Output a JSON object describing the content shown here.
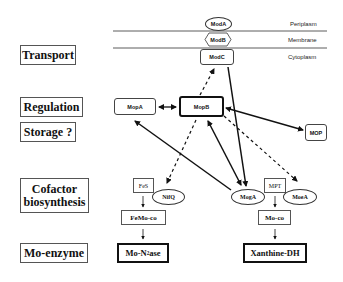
{
  "categories": {
    "transport": "Transport",
    "regulation": "Regulation",
    "storage": "Storage ?",
    "cofactor_line1": "Cofactor",
    "cofactor_line2": "biosynthesis",
    "mo_enzyme": "Mo-enzyme"
  },
  "compartments": {
    "periplasm": "Periplasm",
    "membrane": "Membrane",
    "cytoplasm": "Cytoplasm"
  },
  "nodes": {
    "modA": "ModA",
    "modB": "ModB",
    "modC": "ModC",
    "mopA": "MopA",
    "mopB": "MopB",
    "mop": "MOP",
    "fes": "FeS",
    "nifQ": "NifQ",
    "femoco": "FeMo-co",
    "mo_n2ase_prefix": "Mo-N",
    "mo_n2ase_sub": "2",
    "mo_n2ase_suffix": "ase",
    "mogA": "MogA",
    "mpt": "MPT",
    "moeA": "MoeA",
    "moco": "Mo-co",
    "xanthine_dh": "Xanthine-DH"
  },
  "edges": [
    {
      "from": "ModC",
      "to": "MogA",
      "style": "solid",
      "direction": "forward"
    },
    {
      "from": "MopB",
      "to": "ModC",
      "style": "dashed",
      "direction": "forward"
    },
    {
      "from": "MopA",
      "to": "MopB",
      "style": "solid",
      "direction": "both"
    },
    {
      "from": "MopB",
      "to": "MOP",
      "style": "solid",
      "direction": "both"
    },
    {
      "from": "MopB",
      "to": "MogA",
      "style": "solid",
      "direction": "both"
    },
    {
      "from": "MogA",
      "to": "MopA",
      "style": "solid",
      "direction": "forward"
    },
    {
      "from": "MopB",
      "to": "NifQ",
      "style": "dashed",
      "direction": "forward"
    },
    {
      "from": "MopB",
      "to": "MoeA",
      "style": "dashed",
      "direction": "forward"
    },
    {
      "from": "FeS",
      "to": "FeMo-co",
      "style": "solid",
      "direction": "forward"
    },
    {
      "from": "FeMo-co",
      "to": "Mo-N2ase",
      "style": "solid",
      "direction": "forward"
    },
    {
      "from": "MPT",
      "to": "Mo-co",
      "style": "solid",
      "direction": "forward"
    },
    {
      "from": "Mo-co",
      "to": "Xanthine-DH",
      "style": "solid",
      "direction": "forward"
    }
  ],
  "colors": {
    "line": "#111111",
    "border": "#555555",
    "background": "#ffffff"
  }
}
